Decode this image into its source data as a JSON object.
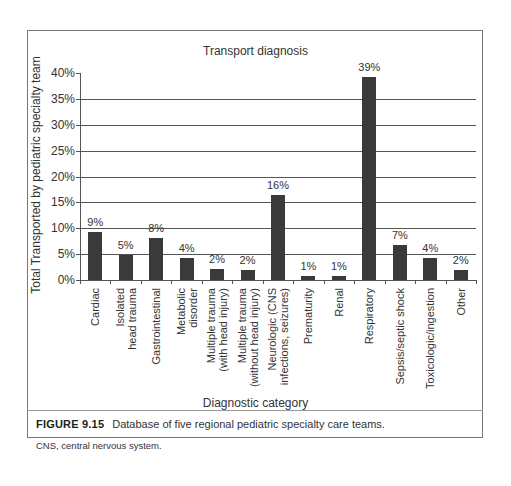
{
  "chart_data": {
    "type": "bar",
    "title": "Transport diagnosis",
    "xlabel": "Diagnostic category",
    "ylabel": "Total Transported by pediatric specialty team",
    "ylim": [
      0,
      40
    ],
    "yticks": [
      "0%",
      "5%",
      "10%",
      "15%",
      "20%",
      "25%",
      "30%",
      "35%",
      "40%"
    ],
    "grid": true,
    "legend": null,
    "categories": [
      "Cardiac",
      "Isolated head trauma",
      "Gastrointestinal",
      "Metabolic disorder",
      "Multiple trauma (with head injury)",
      "Multiple trauma (without head injury)",
      "Neurologic (CNS infections, seizures)",
      "Prematurity",
      "Renal",
      "Respiratory",
      "Sepsis/septic shock",
      "Toxicologic/ingestion",
      "Other"
    ],
    "category_lines": [
      [
        "Cardiac"
      ],
      [
        "Isolated",
        "head trauma"
      ],
      [
        "Gastrointestinal"
      ],
      [
        "Metabolic",
        "disorder"
      ],
      [
        "Multiple trauma",
        "(with head injury)"
      ],
      [
        "Multiple trauma",
        "(without head injury)"
      ],
      [
        "Neurologic (CNS",
        "infections, seizures)"
      ],
      [
        "Prematurity"
      ],
      [
        "Renal"
      ],
      [
        "Respiratory"
      ],
      [
        "Sepsis/septic shock"
      ],
      [
        "Toxicologic/ingestion"
      ],
      [
        "Other"
      ]
    ],
    "values": [
      9.3,
      4.8,
      8.2,
      4.2,
      2.2,
      2.0,
      16.4,
      0.7,
      0.7,
      39.3,
      6.7,
      4.2,
      2.0
    ],
    "data_labels": [
      "9%",
      "5%",
      "8%",
      "4%",
      "2%",
      "2%",
      "16%",
      "1%",
      "1%",
      "39%",
      "7%",
      "4%",
      "2%"
    ]
  },
  "caption": {
    "figure_label": "FIGURE 9.15",
    "text": "Database of five regional pediatric specialty care teams.",
    "note": "CNS, central nervous system."
  }
}
